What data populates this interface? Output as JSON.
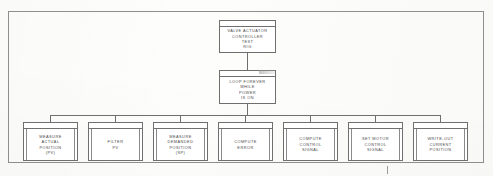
{
  "diagram": {
    "type": "hierarchy-structure-chart",
    "colors": {
      "box_border": "#6f6f6f",
      "frame_border": "#8e8e8e",
      "connector": "#6f6f6f",
      "text": "#4a4a4a",
      "background": "#fdfdfc"
    },
    "root": {
      "id": "valve-actuator-controller-test-rig",
      "lines": [
        "VALVE ACTUATOR",
        "CONTROLLER",
        "TEST",
        "RIG"
      ]
    },
    "loop": {
      "id": "loop-forever-while-power-is-on",
      "lines": [
        "LOOP FOREVER",
        "WHILE",
        "POWER",
        "IS ON"
      ]
    },
    "leaves": [
      {
        "id": "measure-actual-position",
        "lines": [
          "MEASURE",
          "ACTUAL",
          "POSITION",
          "(PV)"
        ]
      },
      {
        "id": "filter-pv",
        "lines": [
          "FILTER",
          "PV"
        ]
      },
      {
        "id": "measure-demanded-position",
        "lines": [
          "MEASURE",
          "DEMANDED",
          "POSITION",
          "(SP)"
        ]
      },
      {
        "id": "compute-error",
        "lines": [
          "COMPUTE",
          "ERROR"
        ]
      },
      {
        "id": "compute-control-signal",
        "lines": [
          "COMPUTE",
          "CONTROL",
          "SIGNAL"
        ]
      },
      {
        "id": "set-motor-control-signal",
        "lines": [
          "SET MOTOR",
          "CONTROL",
          "SIGNAL"
        ]
      },
      {
        "id": "write-out-current-position",
        "lines": [
          "WRITE-OUT",
          "CURRENT",
          "POSITION"
        ]
      }
    ]
  }
}
